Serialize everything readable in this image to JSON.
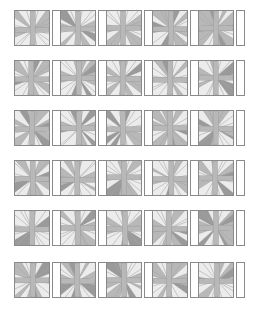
{
  "figure": {
    "title": "",
    "kind": "starburst-tile-grid",
    "background_color": "#ffffff",
    "rows": 6,
    "columns": 5,
    "tile": {
      "shape": "square",
      "size_px": 36,
      "outline_color": "#8a8a8a",
      "fill_color": "#ffffff"
    },
    "separator_bar": {
      "shape": "narrow-vertical-rectangle",
      "width_px": 9,
      "height_px": 36,
      "outline_color": "#8a8a8a",
      "fill_color": "#ffffff"
    },
    "wedge_colors": {
      "light": "#ececec",
      "medium": "#b8b8b8",
      "dark": "#9a9a9a",
      "stroke": "#8f8f8f"
    },
    "row_tops_px": [
      10,
      60,
      110,
      160,
      210,
      262
    ],
    "column_lefts_px": [
      14,
      60,
      106,
      152,
      198
    ],
    "ray_count_per_tile": 20
  },
  "tiles": [
    {
      "row": 0,
      "col": 0,
      "seed": 11,
      "center_x": 0.52,
      "center_y": 0.55
    },
    {
      "row": 0,
      "col": 1,
      "seed": 23,
      "center_x": 0.5,
      "center_y": 0.52
    },
    {
      "row": 0,
      "col": 2,
      "seed": 37,
      "center_x": 0.47,
      "center_y": 0.5
    },
    {
      "row": 0,
      "col": 3,
      "seed": 41,
      "center_x": 0.53,
      "center_y": 0.53
    },
    {
      "row": 0,
      "col": 4,
      "seed": 59,
      "center_x": 0.5,
      "center_y": 0.51
    },
    {
      "row": 1,
      "col": 0,
      "seed": 67,
      "center_x": 0.48,
      "center_y": 0.54
    },
    {
      "row": 1,
      "col": 1,
      "seed": 73,
      "center_x": 0.52,
      "center_y": 0.5
    },
    {
      "row": 1,
      "col": 2,
      "seed": 83,
      "center_x": 0.46,
      "center_y": 0.52
    },
    {
      "row": 1,
      "col": 3,
      "seed": 97,
      "center_x": 0.51,
      "center_y": 0.55
    },
    {
      "row": 1,
      "col": 4,
      "seed": 103,
      "center_x": 0.49,
      "center_y": 0.49
    },
    {
      "row": 2,
      "col": 0,
      "seed": 109,
      "center_x": 0.5,
      "center_y": 0.53
    },
    {
      "row": 2,
      "col": 1,
      "seed": 127,
      "center_x": 0.53,
      "center_y": 0.51
    },
    {
      "row": 2,
      "col": 2,
      "seed": 131,
      "center_x": 0.47,
      "center_y": 0.54
    },
    {
      "row": 2,
      "col": 3,
      "seed": 149,
      "center_x": 0.51,
      "center_y": 0.5
    },
    {
      "row": 2,
      "col": 4,
      "seed": 151,
      "center_x": 0.49,
      "center_y": 0.52
    },
    {
      "row": 3,
      "col": 0,
      "seed": 163,
      "center_x": 0.52,
      "center_y": 0.52
    },
    {
      "row": 3,
      "col": 1,
      "seed": 173,
      "center_x": 0.48,
      "center_y": 0.55
    },
    {
      "row": 3,
      "col": 2,
      "seed": 181,
      "center_x": 0.5,
      "center_y": 0.48
    },
    {
      "row": 3,
      "col": 3,
      "seed": 193,
      "center_x": 0.54,
      "center_y": 0.53
    },
    {
      "row": 3,
      "col": 4,
      "seed": 197,
      "center_x": 0.47,
      "center_y": 0.51
    },
    {
      "row": 4,
      "col": 0,
      "seed": 211,
      "center_x": 0.51,
      "center_y": 0.54
    },
    {
      "row": 4,
      "col": 1,
      "seed": 223,
      "center_x": 0.49,
      "center_y": 0.5
    },
    {
      "row": 4,
      "col": 2,
      "seed": 227,
      "center_x": 0.53,
      "center_y": 0.52
    },
    {
      "row": 4,
      "col": 3,
      "seed": 233,
      "center_x": 0.46,
      "center_y": 0.53
    },
    {
      "row": 4,
      "col": 4,
      "seed": 241,
      "center_x": 0.5,
      "center_y": 0.49
    },
    {
      "row": 5,
      "col": 0,
      "seed": 251,
      "center_x": 0.52,
      "center_y": 0.51
    },
    {
      "row": 5,
      "col": 1,
      "seed": 263,
      "center_x": 0.48,
      "center_y": 0.54
    },
    {
      "row": 5,
      "col": 2,
      "seed": 269,
      "center_x": 0.51,
      "center_y": 0.5
    },
    {
      "row": 5,
      "col": 3,
      "seed": 277,
      "center_x": 0.47,
      "center_y": 0.52
    },
    {
      "row": 5,
      "col": 4,
      "seed": 281,
      "center_x": 0.53,
      "center_y": 0.53
    }
  ]
}
